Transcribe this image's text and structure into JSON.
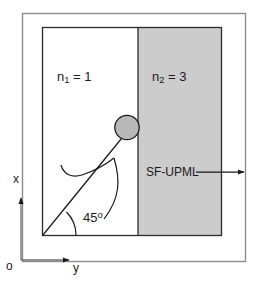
{
  "figure": {
    "type": "schematic-diagram"
  },
  "regions": {
    "left": {
      "name": "medium-1",
      "label_prefix": "n",
      "label_subscript": "1",
      "label_equals": " = ",
      "label_value": "1",
      "fill": "#ffffff"
    },
    "right": {
      "name": "medium-2",
      "label_prefix": "n",
      "label_subscript": "2",
      "label_equals": " = ",
      "label_value": "3",
      "fill": "#cccccc"
    }
  },
  "annotations": {
    "pml_label": "SF-UPML",
    "angle_value": "45",
    "angle_unit": "o"
  },
  "axes": {
    "vertical_label": "x",
    "horizontal_label": "y",
    "origin_label": "o"
  },
  "colors": {
    "pml_fill": "#cccccc",
    "stroke": "#1a1a1a",
    "frame_stroke": "#8c8c8c",
    "background": "#ffffff",
    "spot_fill": "#b8b8b8"
  }
}
